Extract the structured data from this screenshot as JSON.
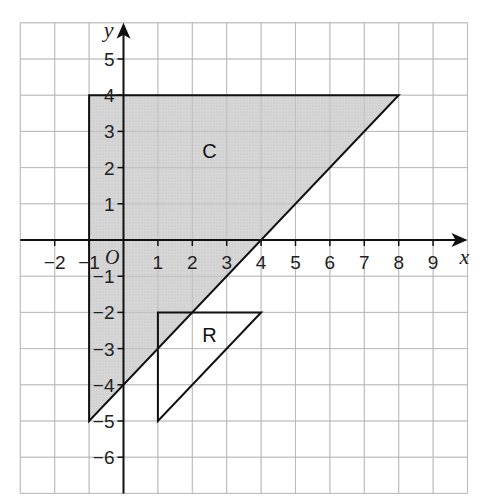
{
  "diagram": {
    "type": "coordinate-grid",
    "x_axis": {
      "label": "x",
      "min": -3,
      "max": 10,
      "tick_labels": [
        "−2",
        "−1",
        "1",
        "2",
        "3",
        "4",
        "5",
        "6",
        "7",
        "8",
        "9"
      ],
      "tick_values": [
        -2,
        -1,
        1,
        2,
        3,
        4,
        5,
        6,
        7,
        8,
        9
      ]
    },
    "y_axis": {
      "label": "y",
      "min": -7,
      "max": 6,
      "tick_labels": [
        "5",
        "4",
        "3",
        "2",
        "1",
        "−1",
        "−2",
        "−3",
        "−4",
        "−5",
        "−6"
      ],
      "tick_values": [
        5,
        4,
        3,
        2,
        1,
        -1,
        -2,
        -3,
        -4,
        -5,
        -6
      ]
    },
    "origin_label": "O",
    "shapes": [
      {
        "name": "C",
        "label": "C",
        "vertices": [
          [
            -1,
            4
          ],
          [
            8,
            4
          ],
          [
            -1,
            -5
          ]
        ],
        "fill": "#d4d4d4",
        "label_pos": [
          2.5,
          2.5
        ]
      },
      {
        "name": "R",
        "label": "R",
        "vertices": [
          [
            1,
            -2
          ],
          [
            4,
            -2
          ],
          [
            1,
            -5
          ]
        ],
        "fill": "none",
        "label_pos": [
          2.5,
          -2.6
        ]
      }
    ],
    "colors": {
      "grid": "#c8c8c8",
      "axis": "#111111",
      "shape_stroke": "#111111",
      "shade": "#d4d4d4"
    }
  }
}
